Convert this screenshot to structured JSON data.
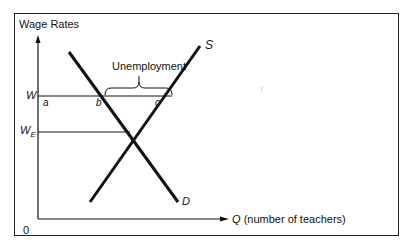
{
  "axes": {
    "y_label": "Wage Rates",
    "x_label_symbol": "Q",
    "x_label_text": "(number of teachers)",
    "origin": "0"
  },
  "wages": {
    "w": "W",
    "we_base": "W",
    "we_sub": "E"
  },
  "points": {
    "a": "a",
    "b": "b",
    "c": "c"
  },
  "curves": {
    "supply": "S",
    "demand": "D"
  },
  "annotation": {
    "unemployment": "Unemployment"
  },
  "stray_mark": "!",
  "colors": {
    "line": "#111111",
    "frame": "#222222",
    "background": "#ffffff"
  }
}
